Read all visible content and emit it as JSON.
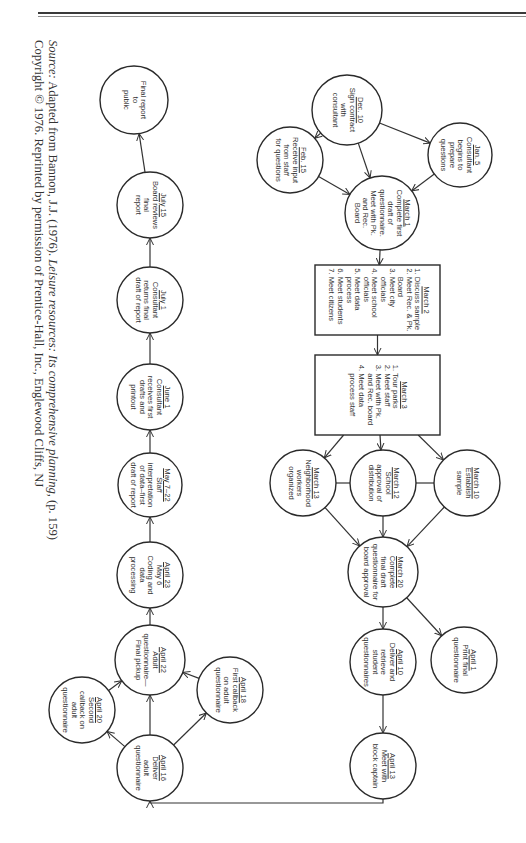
{
  "caption": {
    "line1_prefix": "Source:",
    "line1_text": " Adapted from Bannon, J.J. (1976). ",
    "line1_title": "Leisure resources: Its comprehensive planning,",
    "line1_suffix": " (p. 159)",
    "line2": "Copyright © 1976. Reprinted by permission of Prentice-Hall, Inc., Englewood Cliffs, NJ"
  },
  "nodes": {
    "dec10": {
      "date": "Dec. 10",
      "lines": [
        "Sign contract",
        "with",
        "consultant"
      ]
    },
    "jan5": {
      "date": "Jan. 5",
      "lines": [
        "Consultant",
        "begins to",
        "prepare",
        "questions"
      ]
    },
    "feb15": {
      "date": "Feb. 15",
      "lines": [
        "Receive input",
        "from staff",
        "for questions"
      ]
    },
    "march1": {
      "date": "March 1",
      "lines": [
        "Complete first",
        "draft of",
        "questionnaire.",
        "Meet with Pk.",
        "and Rec.",
        "Board"
      ]
    },
    "march2": {
      "date": "March 2",
      "items": [
        "1. Discuss sample",
        "2. Meet Rec. & Pk.",
        "    Board",
        "3. Meet city",
        "    officials",
        "4. Meet school",
        "    officials",
        "5. Meet data",
        "    process",
        "6. Meet students",
        "7. Meet citizens"
      ]
    },
    "march3": {
      "date": "March 3",
      "items": [
        "1. Tour parks",
        "2. Meet staff",
        "3. Meet with Pk.",
        "    and Rec. board",
        "4. Meet data",
        "    process staff"
      ]
    },
    "march10": {
      "date": "March 10",
      "lines": [
        "Establish",
        "sample"
      ]
    },
    "march12": {
      "date": "March 12",
      "lines": [
        "School",
        "approval of",
        "distribution"
      ]
    },
    "march13": {
      "date": "March 13",
      "lines": [
        "Neighborhood",
        "workers",
        "organized"
      ]
    },
    "march20": {
      "date": "March 20",
      "lines": [
        "Complete",
        "final draft",
        "questionnaire for",
        "board approval"
      ]
    },
    "april1": {
      "date": "April 1",
      "lines": [
        "Print final",
        "questionnaire"
      ]
    },
    "april10": {
      "date": "April 10",
      "lines": [
        "Deliver and",
        "retrieve",
        "student",
        "questionnaires"
      ]
    },
    "april13": {
      "date": "April 13",
      "lines": [
        "Meet with",
        "block captain"
      ]
    },
    "april16": {
      "date": "April 16",
      "lines": [
        "Deliver",
        "adult",
        "questionnaire"
      ]
    },
    "april18": {
      "date": "April 18",
      "lines": [
        "First callback",
        "on adult",
        "questionnaire"
      ]
    },
    "april20": {
      "date": "April 20",
      "lines": [
        "Second",
        "callback on",
        "adult",
        "questionnaire"
      ]
    },
    "april22": {
      "date": "April 22",
      "lines": [
        "Adult",
        "questionnaire—",
        "Final pickup"
      ]
    },
    "april23": {
      "date": "April 23",
      "lines": [
        "May 6",
        "Coding and",
        "data",
        "processing"
      ]
    },
    "may7": {
      "date": "May 7–22",
      "lines": [
        "Staff",
        "interpretation",
        "of data–first",
        "draft of report"
      ]
    },
    "june1": {
      "date": "June 1",
      "lines": [
        "Consultant",
        "receives first",
        "drafts and",
        "printout"
      ]
    },
    "july1": {
      "date": "July 1",
      "lines": [
        "Consultant",
        "returns final",
        "draft of report"
      ]
    },
    "july15": {
      "date": "July 15",
      "lines": [
        "Board reviews",
        "final",
        "report"
      ]
    },
    "final": {
      "date": "",
      "lines": [
        "Final report",
        "to",
        "public"
      ]
    }
  }
}
